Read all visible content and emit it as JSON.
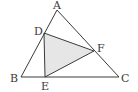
{
  "diagram": {
    "type": "geometry",
    "colors": {
      "stroke": "#3a3a3a",
      "fill": "#e6e6e6",
      "background": "#ffffff"
    },
    "points": {
      "A": {
        "label": "A",
        "x": 57,
        "y": 10,
        "lx": 53,
        "ly": 9
      },
      "B": {
        "label": "B",
        "x": 21,
        "y": 77,
        "lx": 10,
        "ly": 82
      },
      "C": {
        "label": "C",
        "x": 119,
        "y": 77,
        "lx": 121,
        "ly": 82
      },
      "D": {
        "label": "D",
        "x": 44,
        "y": 33,
        "lx": 34,
        "ly": 35
      },
      "E": {
        "label": "E",
        "x": 45,
        "y": 77,
        "lx": 41,
        "ly": 90
      },
      "F": {
        "label": "F",
        "x": 94,
        "y": 51,
        "lx": 97,
        "ly": 52
      }
    },
    "outer_triangle": [
      "A",
      "B",
      "C"
    ],
    "inner_triangle": [
      "D",
      "E",
      "F"
    ],
    "labels": [
      "A",
      "B",
      "C",
      "D",
      "E",
      "F"
    ]
  }
}
